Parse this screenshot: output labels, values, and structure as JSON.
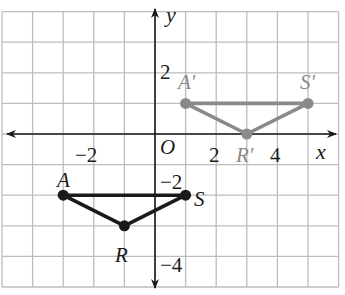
{
  "figure": {
    "grid": {
      "origin_px": [
        155,
        134
      ],
      "unit_px": 30.6,
      "x_range": [
        -5,
        6
      ],
      "y_range": [
        -5,
        4
      ],
      "line_color": "#bdbdbd",
      "axis_color": "#1a1a1a"
    },
    "axes": {
      "x_label": "x",
      "y_label": "y",
      "origin_label": "O",
      "tick_labels": {
        "x_neg2": "−2",
        "x_2": "2",
        "x_4": "4",
        "y_2": "2",
        "y_neg2": "−2",
        "y_neg4": "−4"
      }
    },
    "preimage": {
      "name": "ARS",
      "color": "#1a1a1a",
      "vertices": [
        {
          "label": "A",
          "x": -3,
          "y": -2
        },
        {
          "label": "R",
          "x": -1,
          "y": -3
        },
        {
          "label": "S",
          "x": 1,
          "y": -2
        }
      ]
    },
    "image": {
      "name": "A'R'S'",
      "color": "#8a8a8a",
      "vertices": [
        {
          "label": "A′",
          "x": 1,
          "y": 1
        },
        {
          "label": "R′",
          "x": 3,
          "y": 0
        },
        {
          "label": "S′",
          "x": 5,
          "y": 1
        }
      ]
    }
  }
}
